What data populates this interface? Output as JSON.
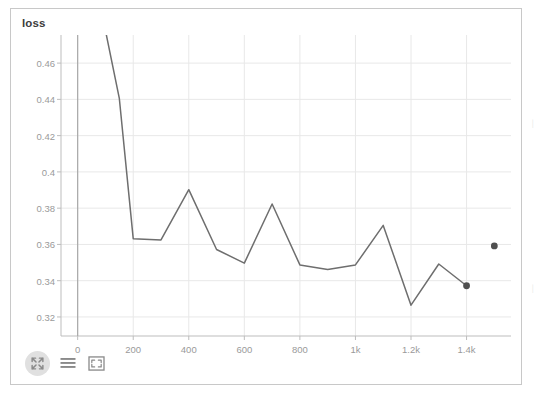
{
  "panel": {
    "title": "loss"
  },
  "toolbar": {
    "items": [
      {
        "name": "fullscreen-circle-icon",
        "label": "Fullscreen"
      },
      {
        "name": "menu-lines-icon",
        "label": "Menu"
      },
      {
        "name": "expand-corners-icon",
        "label": "Expand"
      }
    ]
  },
  "chart_data": {
    "type": "line",
    "title": "loss",
    "xlabel": "",
    "ylabel": "",
    "xlim": [
      -60,
      1560
    ],
    "ylim": [
      0.3095,
      0.4755
    ],
    "grid": true,
    "legend": null,
    "line_color": "#6e6e6e",
    "grid_color": "#e8e8e8",
    "axis_color": "#bdbdbd",
    "tick_color": "#9a9a9a",
    "yticks": [
      0.32,
      0.34,
      0.36,
      0.38,
      0.4,
      0.42,
      0.44,
      0.46
    ],
    "ytick_labels": [
      "0.32",
      "0.34",
      "0.36",
      "0.38",
      "0.4",
      "0.42",
      "0.44",
      "0.46"
    ],
    "xticks": [
      0,
      200,
      400,
      600,
      800,
      1000,
      1200,
      1400
    ],
    "xtick_labels": [
      "0",
      "200",
      "400",
      "600",
      "800",
      "1k",
      "1.2k",
      "1.4k"
    ],
    "series": [
      {
        "name": "loss",
        "x": [
          100,
          150,
          200,
          300,
          400,
          500,
          600,
          700,
          800,
          900,
          1000,
          1100,
          1200,
          1300,
          1400
        ],
        "values": [
          0.478,
          0.4405,
          0.3632,
          0.3625,
          0.3902,
          0.3572,
          0.3497,
          0.3823,
          0.3487,
          0.3462,
          0.3487,
          0.3705,
          0.3265,
          0.3492,
          0.3372
        ],
        "marker_points": [
          {
            "x": 1400,
            "y": 0.3372
          }
        ]
      },
      {
        "name": "isolated-point",
        "x": [
          1500
        ],
        "values": [
          0.3592
        ],
        "marker_only": true
      }
    ]
  }
}
